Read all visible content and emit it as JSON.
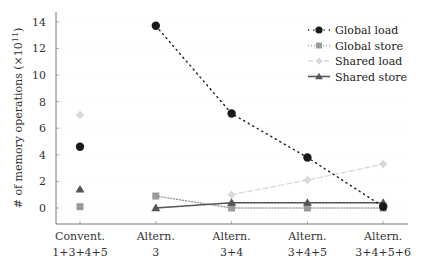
{
  "chart_data": {
    "type": "line",
    "title": "",
    "xlabel": "",
    "ylabel": "# of memory operations (×10^11)",
    "ylabel_parts": {
      "text": "# of memory operations (×10",
      "sup": "11",
      "close": ")"
    },
    "ylim": [
      -1,
      14.5
    ],
    "yticks": [
      0,
      2,
      4,
      6,
      8,
      10,
      12,
      14
    ],
    "grid": true,
    "legend_position": "upper right",
    "categories": [
      {
        "line1": "Convent.",
        "line2": "1+3+4+5"
      },
      {
        "line1": "Altern.",
        "line2": "3"
      },
      {
        "line1": "Altern.",
        "line2": "3+4"
      },
      {
        "line1": "Altern.",
        "line2": "3+4+5"
      },
      {
        "line1": "Altern.",
        "line2": "3+4+5+6"
      }
    ],
    "series": [
      {
        "name": "Global load",
        "marker": "circle",
        "line": "dotted",
        "color": "#1a1a1a",
        "values": [
          4.6,
          13.7,
          7.1,
          3.8,
          0.1
        ],
        "connect_from": 1
      },
      {
        "name": "Global store",
        "marker": "square",
        "line": "densely-dotted",
        "color": "#9a9a9a",
        "values": [
          0.1,
          0.9,
          0.0,
          0.0,
          0.0
        ],
        "connect_from": 1
      },
      {
        "name": "Shared load",
        "marker": "diamond",
        "line": "dashed",
        "color": "#d9d9d9",
        "values": [
          7.0,
          null,
          1.0,
          2.1,
          3.3
        ],
        "connect_from": 2
      },
      {
        "name": "Shared store",
        "marker": "triangle",
        "line": "solid",
        "color": "#555555",
        "values": [
          1.4,
          0.0,
          0.4,
          0.4,
          0.4
        ],
        "connect_from": 1
      }
    ]
  }
}
